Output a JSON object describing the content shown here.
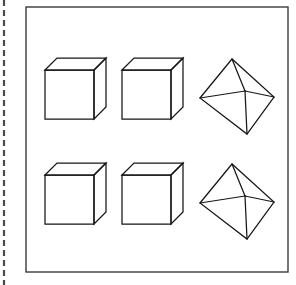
{
  "figure": {
    "background_color": "#ffffff",
    "line_color": "#161616",
    "frame_color": "#3b3b3b",
    "margin_rule_color": "#4a4a4a",
    "canvas": {
      "width": 296,
      "height": 285
    },
    "frame": {
      "x": 26,
      "y": 7,
      "width": 262,
      "height": 265
    },
    "margin_rule": {
      "x": 4,
      "y_start": 0,
      "y_end": 285,
      "style": "dashed"
    },
    "rows": [
      {
        "name": "top-row",
        "items": [
          {
            "name": "cube-top-left",
            "shape": "cube",
            "label": "",
            "projection": "oblique",
            "bbox": {
              "x": 45,
              "y": 58,
              "width": 61,
              "height": 61
            }
          },
          {
            "name": "cube-top-middle",
            "shape": "cube",
            "label": "",
            "projection": "oblique",
            "bbox": {
              "x": 122,
              "y": 58,
              "width": 61,
              "height": 61
            }
          },
          {
            "name": "octahedron-top-right",
            "shape": "octahedron",
            "label": "",
            "projection": "perspective",
            "bbox": {
              "x": 200,
              "y": 59,
              "width": 74,
              "height": 75
            }
          }
        ]
      },
      {
        "name": "bottom-row",
        "items": [
          {
            "name": "cube-bottom-left",
            "shape": "cube",
            "label": "",
            "projection": "oblique",
            "bbox": {
              "x": 45,
              "y": 163,
              "width": 61,
              "height": 61
            }
          },
          {
            "name": "cube-bottom-middle",
            "shape": "cube",
            "label": "",
            "projection": "oblique",
            "bbox": {
              "x": 122,
              "y": 163,
              "width": 61,
              "height": 61
            }
          },
          {
            "name": "octahedron-bottom-right",
            "shape": "octahedron",
            "label": "",
            "projection": "perspective",
            "bbox": {
              "x": 200,
              "y": 164,
              "width": 74,
              "height": 75
            }
          }
        ]
      }
    ],
    "shape_geometry": {
      "cube": {
        "front_face": [
          [
            0,
            12
          ],
          [
            49,
            12
          ],
          [
            49,
            61
          ],
          [
            0,
            61
          ]
        ],
        "top_face": [
          [
            0,
            12
          ],
          [
            12,
            0
          ],
          [
            61,
            0
          ],
          [
            49,
            12
          ]
        ],
        "right_face": [
          [
            49,
            12
          ],
          [
            61,
            0
          ],
          [
            61,
            49
          ],
          [
            49,
            61
          ]
        ],
        "hidden_edges_shown": false,
        "visible_faces": [
          "front",
          "top",
          "right"
        ]
      },
      "octahedron": {
        "apex": [
          32,
          0
        ],
        "left": [
          0,
          39
        ],
        "right": [
          74,
          38
        ],
        "bottom": [
          47,
          75
        ],
        "center": [
          45,
          32
        ],
        "outline": [
          [
            32,
            0
          ],
          [
            0,
            39
          ],
          [
            47,
            75
          ],
          [
            74,
            38
          ]
        ],
        "interior_edges": [
          [
            [
              32,
              0
            ],
            [
              45,
              32
            ]
          ],
          [
            [
              0,
              39
            ],
            [
              45,
              32
            ]
          ],
          [
            [
              74,
              38
            ],
            [
              45,
              32
            ]
          ],
          [
            [
              47,
              75
            ],
            [
              45,
              32
            ]
          ]
        ]
      }
    }
  }
}
